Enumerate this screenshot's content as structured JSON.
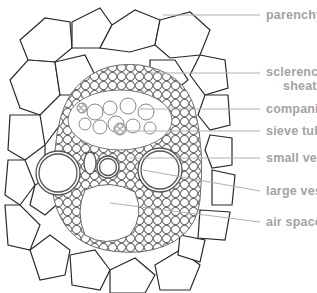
{
  "diagram": {
    "colors": {
      "cell_outline": "#2a2a2a",
      "inner_tissue": "#6e6e6e",
      "label_text": "#a3a3a3",
      "leader_line": "#b0b0b0"
    },
    "labels": [
      {
        "id": "parenchyma",
        "text": "parenchyma",
        "x": 266,
        "y": 9,
        "line": {
          "x1": 163,
          "y1": 15,
          "x2": 260,
          "y2": 15
        }
      },
      {
        "id": "sclerenchyma",
        "text": "sclerenchyma",
        "x": 266,
        "y": 66,
        "line": {
          "x1": 150,
          "y1": 73,
          "x2": 260,
          "y2": 73
        }
      },
      {
        "id": "sheath",
        "text": "sheath",
        "x": 283,
        "y": 80
      },
      {
        "id": "companion-cell",
        "text": "companion  cell",
        "x": 266,
        "y": 103,
        "line": {
          "x1": 140,
          "y1": 109,
          "x2": 260,
          "y2": 109
        }
      },
      {
        "id": "sieve-tube",
        "text": "sieve tube",
        "x": 266,
        "y": 125,
        "line": {
          "x1": 125,
          "y1": 131,
          "x2": 260,
          "y2": 131
        }
      },
      {
        "id": "small-vessels",
        "text": "small vessels",
        "x": 266,
        "y": 152,
        "line": {
          "x1": 130,
          "y1": 158,
          "x2": 260,
          "y2": 158
        }
      },
      {
        "id": "large-vessel",
        "text": "large vessel",
        "x": 266,
        "y": 185,
        "line": {
          "x1": 143,
          "y1": 170,
          "x2": 260,
          "y2": 191
        }
      },
      {
        "id": "air-space",
        "text": "air space",
        "x": 266,
        "y": 216,
        "line": {
          "x1": 110,
          "y1": 203,
          "x2": 260,
          "y2": 222
        }
      }
    ]
  }
}
